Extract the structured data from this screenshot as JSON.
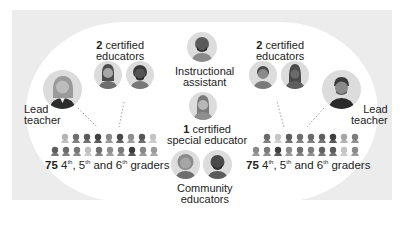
{
  "colors": {
    "panel_bg": "#ececec",
    "stadium_bg": "#ffffff",
    "avatar_bg": "#dcdcdc",
    "text": "#222222"
  },
  "left_team": {
    "educators_count": "2",
    "educators_label": "certified",
    "educators_label2": "educators",
    "lead_label1": "Lead",
    "lead_label2": "teacher",
    "students_count": "75",
    "students_g4": "4",
    "students_g5": "5",
    "students_g6": "6",
    "th": "th",
    "students_sep1": ", ",
    "students_sep2": " and ",
    "students_suffix": " graders",
    "student_shades_row1": [
      "#b5b5b5",
      "#6d6d6d",
      "#5a5a5a",
      "#3f3f3f",
      "#8a8a8a",
      "#4a4a4a",
      "#8f8f8f",
      "#555555",
      "#c3c3c3"
    ],
    "student_shades_row2": [
      "#5e5e5e",
      "#6a6a6a",
      "#777777",
      "#c0c0c0",
      "#6e6e6e",
      "#8d8d8d",
      "#7a7a7a",
      "#3c3c3c",
      "#868686",
      "#9a9a9a"
    ]
  },
  "right_team": {
    "educators_count": "2",
    "educators_label": "certified",
    "educators_label2": "educators",
    "lead_label1": "Lead",
    "lead_label2": "teacher",
    "students_count": "75",
    "students_g4": "4",
    "students_g5": "5",
    "students_g6": "6",
    "th": "th",
    "students_sep1": ", ",
    "students_sep2": " and ",
    "students_suffix": " graders",
    "student_shades_row1": [
      "#6a6a6a",
      "#c6c6c6",
      "#5c5c5c",
      "#707070",
      "#6a6a6a",
      "#5e5e5e",
      "#3e3e3e",
      "#a6a6a6",
      "#7c7c7c"
    ],
    "student_shades_row2": [
      "#8a8a8a",
      "#7a7a7a",
      "#3e3e3e",
      "#8c8c8c",
      "#6f6f6f",
      "#7d7d7d",
      "#626262",
      "#5b5b5b",
      "#c4c4c4",
      "#8a8a8a"
    ]
  },
  "center": {
    "instructional_label1": "Instructional",
    "instructional_label2": "assistant",
    "special_count": "1",
    "special_label1": "certified",
    "special_label2": "special educator",
    "community_label1": "Community",
    "community_label2": "educators"
  }
}
